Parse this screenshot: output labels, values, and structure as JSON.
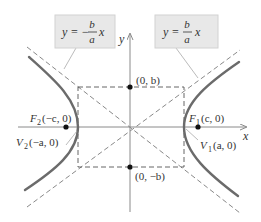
{
  "diagram": {
    "axes": {
      "x_label": "x",
      "y_label": "y"
    },
    "asymptote_labels": {
      "negative": {
        "lhs": "y =",
        "sign": "−",
        "num": "b",
        "den": "a",
        "var": "x"
      },
      "positive": {
        "lhs": "y =",
        "num": "b",
        "den": "a",
        "var": "x"
      }
    },
    "points": {
      "co_vertex_top": "(0, b)",
      "co_vertex_bottom": "(0, −b)",
      "focus_right": {
        "name": "F",
        "sub": "1",
        "coords": "(c, 0)"
      },
      "focus_left": {
        "name": "F",
        "sub": "2",
        "coords": "(−c, 0)"
      },
      "vertex_right": {
        "name": "V",
        "sub": "1",
        "coords": "(a, 0)"
      },
      "vertex_left": {
        "name": "V",
        "sub": "2",
        "coords": "(−a, 0)"
      }
    },
    "colors": {
      "curve": "#6b6b6b",
      "axis": "#8a8a8a",
      "dashed": "#7a7a7a",
      "box_fill": "#e8e8e8",
      "point": "#111111",
      "text": "#333333"
    }
  }
}
